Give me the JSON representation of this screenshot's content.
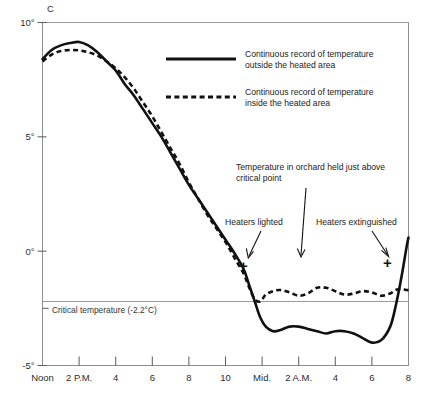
{
  "chart_data": {
    "type": "line",
    "title": "",
    "xlabel": "",
    "ylabel": "C",
    "ylim": [
      -5,
      10
    ],
    "xlim": [
      12,
      32
    ],
    "grid": true,
    "legend_position": "upper-right-inside",
    "y_ticks": [
      "10°",
      "5°",
      "0°",
      "-5°"
    ],
    "y_tick_values": [
      10,
      5,
      0,
      -5
    ],
    "x_tick_labels": [
      "Noon",
      "2 P.M.",
      "4",
      "6",
      "8",
      "10",
      "Mid.",
      "2 A.M.",
      "4",
      "6",
      "8"
    ],
    "x_tick_values": [
      12,
      14,
      16,
      18,
      20,
      22,
      24,
      26,
      28,
      30,
      32
    ],
    "critical_temperature": -2.2,
    "critical_label": "Critical temperature (-2.2°C)",
    "series": [
      {
        "name": "Continuous record of temperature outside the heated area",
        "style": "solid",
        "color": "#111111",
        "x": [
          12.0,
          12.5,
          13.0,
          13.5,
          14.0,
          14.5,
          15.0,
          15.5,
          16.0,
          16.5,
          17.0,
          17.5,
          18.0,
          18.5,
          19.0,
          19.5,
          20.0,
          20.5,
          21.0,
          21.5,
          22.0,
          22.5,
          23.0,
          23.3,
          23.6,
          23.9,
          24.2,
          24.6,
          25.0,
          25.5,
          26.0,
          26.5,
          27.0,
          27.5,
          28.0,
          28.5,
          29.0,
          29.5,
          30.0,
          30.5,
          31.0,
          31.3,
          31.6,
          31.9,
          32.0
        ],
        "y": [
          8.4,
          8.8,
          9.0,
          9.1,
          9.15,
          9.0,
          8.7,
          8.3,
          7.9,
          7.3,
          6.8,
          6.2,
          5.6,
          5.0,
          4.3,
          3.6,
          2.9,
          2.3,
          1.7,
          1.1,
          0.5,
          -0.1,
          -0.8,
          -1.5,
          -2.2,
          -2.9,
          -3.3,
          -3.5,
          -3.45,
          -3.3,
          -3.3,
          -3.4,
          -3.5,
          -3.6,
          -3.5,
          -3.5,
          -3.6,
          -3.8,
          -4.0,
          -3.9,
          -3.3,
          -2.4,
          -1.2,
          0.2,
          0.6
        ]
      },
      {
        "name": "Continuous record of temperature inside the heated area",
        "style": "dashed",
        "color": "#111111",
        "x": [
          12.0,
          12.5,
          13.0,
          13.5,
          14.0,
          14.5,
          15.0,
          15.5,
          16.0,
          16.5,
          17.0,
          17.5,
          18.0,
          18.5,
          19.0,
          19.5,
          20.0,
          20.5,
          21.0,
          21.5,
          22.0,
          22.5,
          23.0,
          23.3,
          23.6,
          23.9,
          24.2,
          24.6,
          25.0,
          25.5,
          26.0,
          26.5,
          27.0,
          27.5,
          28.0,
          28.5,
          29.0,
          29.5,
          30.0,
          30.5,
          31.0,
          31.3,
          31.6,
          31.9,
          32.0
        ],
        "y": [
          8.3,
          8.6,
          8.75,
          8.8,
          8.78,
          8.7,
          8.55,
          8.3,
          8.0,
          7.6,
          7.1,
          6.5,
          5.9,
          5.2,
          4.5,
          3.8,
          3.0,
          2.3,
          1.6,
          1.0,
          0.4,
          -0.3,
          -1.0,
          -1.6,
          -2.1,
          -2.2,
          -1.9,
          -1.75,
          -1.7,
          -1.8,
          -1.95,
          -1.85,
          -1.6,
          -1.6,
          -1.75,
          -1.9,
          -1.85,
          -1.75,
          -1.8,
          -1.95,
          -1.85,
          -1.7,
          -1.65,
          -1.7,
          -1.7
        ]
      }
    ],
    "annotations": [
      {
        "name": "orchard-note",
        "text_line_1": "Temperature in orchard held just above",
        "text_line_2": "critical point",
        "points_to_x": 27.2,
        "points_to_y": -1.6
      },
      {
        "name": "heaters-lighted",
        "text": "Heaters lighted",
        "points_to_x": 24.0,
        "points_to_y": -2.2,
        "marker": "+"
      },
      {
        "name": "heaters-extinguished",
        "text": "Heaters extinguished",
        "points_to_x": 31.0,
        "points_to_y": -1.9,
        "marker": "+"
      }
    ]
  },
  "axis": {
    "y_unit_label": "C",
    "y_ticks": [
      {
        "label": "10°",
        "value": 10
      },
      {
        "label": "5°",
        "value": 5
      },
      {
        "label": "0°",
        "value": 0
      },
      {
        "label": "-5°",
        "value": -5
      }
    ],
    "x_ticks": [
      {
        "label": "Noon",
        "value": 12
      },
      {
        "label": "2 P.M.",
        "value": 14
      },
      {
        "label": "4",
        "value": 16
      },
      {
        "label": "6",
        "value": 18
      },
      {
        "label": "8",
        "value": 20
      },
      {
        "label": "10",
        "value": 22
      },
      {
        "label": "Mid.",
        "value": 24
      },
      {
        "label": "2 A.M.",
        "value": 26
      },
      {
        "label": "4",
        "value": 28
      },
      {
        "label": "6",
        "value": 30
      },
      {
        "label": "8",
        "value": 32
      }
    ]
  },
  "legend": {
    "entries": [
      {
        "style": "solid",
        "line_1": "Continuous record of temperature",
        "line_2": "outside the heated area"
      },
      {
        "style": "dashed",
        "line_1": "Continuous record of temperature",
        "line_2": "inside the heated area"
      }
    ]
  },
  "critical_line": {
    "label": "Critical temperature (-2.2°C)",
    "value": -2.2
  },
  "annotations": {
    "orchard_line_1": "Temperature in orchard held just above",
    "orchard_line_2": "critical point",
    "heaters_lighted": "Heaters lighted",
    "heaters_extinguished": "Heaters extinguished",
    "marker_glyph": "+"
  },
  "colors": {
    "curve": "#111111",
    "frame": "#8d8d8d",
    "grid": "#9a9a9a",
    "text": "#222222",
    "background": "#ffffff"
  }
}
